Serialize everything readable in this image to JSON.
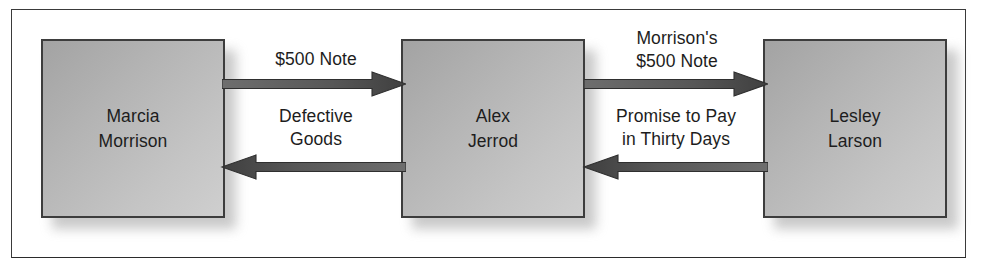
{
  "figure": {
    "caption_remnant": "",
    "frame_border_color": "#3a3a3a",
    "background_color": "#ffffff",
    "node_fill_light": "#cfcfcf",
    "node_fill_dark": "#a3a3a3",
    "arrow_color": "#4a4a4a",
    "text_color": "#1d1d1d"
  },
  "nodes": [
    {
      "id": "marcia",
      "label": "Marcia\nMorrison"
    },
    {
      "id": "alex",
      "label": "Alex\nJerrod"
    },
    {
      "id": "lesley",
      "label": "Lesley\nLarson"
    }
  ],
  "edges": [
    {
      "id": "marcia-to-alex",
      "from": "Marcia Morrison",
      "to": "Alex Jerrod",
      "direction": "right",
      "label": "$500 Note"
    },
    {
      "id": "alex-to-marcia",
      "from": "Alex Jerrod",
      "to": "Marcia Morrison",
      "direction": "left",
      "label": "Defective\nGoods"
    },
    {
      "id": "alex-to-lesley",
      "from": "Alex Jerrod",
      "to": "Lesley Larson",
      "direction": "right",
      "label": "Morrison's\n$500 Note"
    },
    {
      "id": "lesley-to-alex",
      "from": "Lesley Larson",
      "to": "Alex Jerrod",
      "direction": "left",
      "label": "Promise to Pay\nin Thirty Days"
    }
  ]
}
